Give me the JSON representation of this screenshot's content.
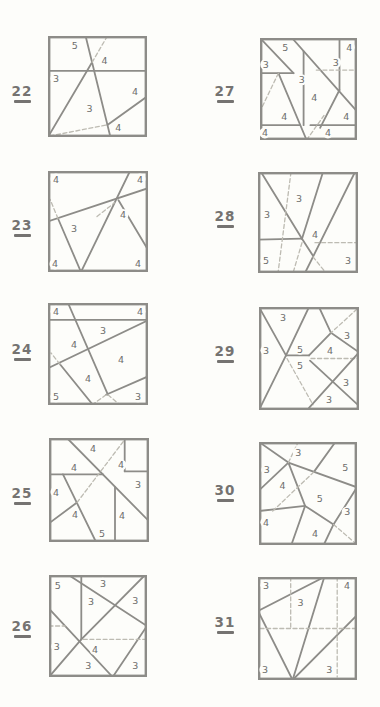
{
  "page": {
    "kind": "geometry-puzzle-sheet"
  },
  "colors": {
    "background": "#fdfdfa",
    "line": "#8d8c88",
    "dash": "#bdbbb2",
    "digit": "#6e6e6c",
    "number": "#757371"
  },
  "puzzles": [
    {
      "number": "22",
      "box": {
        "x": 48,
        "y": 36,
        "w": 99,
        "h": 101
      },
      "num_pos": {
        "x": 6,
        "y": 85
      },
      "segments": [
        [
          0,
          0.345,
          1,
          0.345,
          0
        ],
        [
          0.38,
          0,
          0.63,
          1,
          0
        ],
        [
          0,
          1,
          0.445,
          0.26,
          0
        ],
        [
          0.445,
          0.26,
          0.6,
          0,
          1
        ],
        [
          1,
          0.6,
          0.6,
          0.88,
          0
        ],
        [
          0.02,
          0.99,
          0.6,
          0.88,
          1
        ]
      ],
      "labels": [
        {
          "t": "5",
          "x": 0.27,
          "y": 0.09
        },
        {
          "t": "4",
          "x": 0.57,
          "y": 0.24
        },
        {
          "t": "3",
          "x": 0.08,
          "y": 0.42
        },
        {
          "t": "3",
          "x": 0.42,
          "y": 0.72
        },
        {
          "t": "4",
          "x": 0.88,
          "y": 0.55
        },
        {
          "t": "4",
          "x": 0.71,
          "y": 0.91
        }
      ]
    },
    {
      "number": "23",
      "box": {
        "x": 48,
        "y": 171,
        "w": 100,
        "h": 101
      },
      "num_pos": {
        "x": 6,
        "y": 219
      },
      "segments": [
        [
          0,
          0.5,
          1,
          0.17,
          0
        ],
        [
          0.82,
          0,
          0.33,
          1,
          0
        ],
        [
          0.33,
          1,
          0.1,
          0.47,
          0
        ],
        [
          0.1,
          0.47,
          0.02,
          0.28,
          1
        ],
        [
          0.705,
          0.29,
          1,
          0.78,
          0
        ],
        [
          0.49,
          0.45,
          0.665,
          0.315,
          1
        ]
      ],
      "labels": [
        {
          "t": "4",
          "x": 0.08,
          "y": 0.08
        },
        {
          "t": "4",
          "x": 0.92,
          "y": 0.08
        },
        {
          "t": "4",
          "x": 0.75,
          "y": 0.43
        },
        {
          "t": "3",
          "x": 0.26,
          "y": 0.57
        },
        {
          "t": "4",
          "x": 0.07,
          "y": 0.92
        },
        {
          "t": "4",
          "x": 0.9,
          "y": 0.92
        }
      ]
    },
    {
      "number": "24",
      "box": {
        "x": 48,
        "y": 303,
        "w": 100,
        "h": 102
      },
      "num_pos": {
        "x": 6,
        "y": 343
      },
      "segments": [
        [
          0,
          0.165,
          1,
          0.165,
          0
        ],
        [
          0.2,
          0,
          0.6,
          0.9,
          0
        ],
        [
          1,
          0.17,
          0,
          0.64,
          0
        ],
        [
          0.12,
          0.6,
          0.45,
          1,
          0
        ],
        [
          0.12,
          0.6,
          0.03,
          0.49,
          1
        ],
        [
          1,
          0.72,
          0.58,
          0.9,
          0
        ],
        [
          0.58,
          0.9,
          0.44,
          1,
          1
        ],
        [
          0.6,
          0.9,
          0.72,
          1,
          1
        ]
      ],
      "labels": [
        {
          "t": "4",
          "x": 0.08,
          "y": 0.08
        },
        {
          "t": "4",
          "x": 0.92,
          "y": 0.08
        },
        {
          "t": "3",
          "x": 0.55,
          "y": 0.27
        },
        {
          "t": "4",
          "x": 0.26,
          "y": 0.41
        },
        {
          "t": "4",
          "x": 0.73,
          "y": 0.55
        },
        {
          "t": "4",
          "x": 0.4,
          "y": 0.74
        },
        {
          "t": "5",
          "x": 0.08,
          "y": 0.92
        },
        {
          "t": "3",
          "x": 0.9,
          "y": 0.92
        }
      ]
    },
    {
      "number": "25",
      "box": {
        "x": 49,
        "y": 438,
        "w": 100,
        "h": 104
      },
      "num_pos": {
        "x": 6,
        "y": 487
      },
      "segments": [
        [
          0.18,
          0,
          1,
          0.8,
          0
        ],
        [
          0,
          0.35,
          0.54,
          0.35,
          0
        ],
        [
          0.757,
          0,
          0.757,
          0.32,
          0
        ],
        [
          0.757,
          0.32,
          1,
          0.32,
          0
        ],
        [
          0.14,
          0.35,
          0.47,
          1,
          0
        ],
        [
          0,
          0.82,
          0.28,
          0.62,
          0
        ],
        [
          0.28,
          0.62,
          0.77,
          0,
          1
        ],
        [
          0.66,
          0.47,
          0.66,
          1,
          0
        ]
      ],
      "labels": [
        {
          "t": "4",
          "x": 0.44,
          "y": 0.1
        },
        {
          "t": "4",
          "x": 0.25,
          "y": 0.28
        },
        {
          "t": "4",
          "x": 0.72,
          "y": 0.26
        },
        {
          "t": "3",
          "x": 0.89,
          "y": 0.45
        },
        {
          "t": "4",
          "x": 0.07,
          "y": 0.52
        },
        {
          "t": "4",
          "x": 0.26,
          "y": 0.74
        },
        {
          "t": "4",
          "x": 0.73,
          "y": 0.75
        },
        {
          "t": "5",
          "x": 0.53,
          "y": 0.92
        }
      ]
    },
    {
      "number": "26",
      "box": {
        "x": 49,
        "y": 575,
        "w": 98,
        "h": 102
      },
      "num_pos": {
        "x": 6,
        "y": 620
      },
      "segments": [
        [
          0.33,
          0,
          0.33,
          0.63,
          0
        ],
        [
          0.2,
          0,
          1,
          0.5,
          0
        ],
        [
          0.98,
          0,
          0.33,
          0.63,
          0
        ],
        [
          0,
          0.33,
          0.65,
          1,
          0
        ],
        [
          0.33,
          0.63,
          0,
          1,
          0
        ],
        [
          1,
          0.5,
          0.65,
          1,
          0
        ],
        [
          0,
          0.5,
          0.165,
          0.5,
          1
        ],
        [
          0.35,
          0.63,
          1,
          0.63,
          1
        ]
      ],
      "labels": [
        {
          "t": "5",
          "x": 0.09,
          "y": 0.1
        },
        {
          "t": "3",
          "x": 0.55,
          "y": 0.08
        },
        {
          "t": "3",
          "x": 0.43,
          "y": 0.26
        },
        {
          "t": "3",
          "x": 0.88,
          "y": 0.25
        },
        {
          "t": "3",
          "x": 0.08,
          "y": 0.7
        },
        {
          "t": "4",
          "x": 0.47,
          "y": 0.73
        },
        {
          "t": "3",
          "x": 0.4,
          "y": 0.89
        },
        {
          "t": "3",
          "x": 0.88,
          "y": 0.89
        }
      ]
    },
    {
      "number": "27",
      "box": {
        "x": 260,
        "y": 38,
        "w": 97,
        "h": 102
      },
      "num_pos": {
        "x": 209,
        "y": 85
      },
      "segments": [
        [
          0,
          0,
          0.345,
          0.345,
          0
        ],
        [
          0,
          0.345,
          0.345,
          0.345,
          0
        ],
        [
          0.33,
          0,
          1,
          0.72,
          0
        ],
        [
          0.82,
          0,
          0.82,
          0.51,
          0
        ],
        [
          0.58,
          0.315,
          1,
          0.315,
          1
        ],
        [
          0.45,
          0.13,
          0.45,
          0.855,
          0
        ],
        [
          0.82,
          0.51,
          0.62,
          0.88,
          0
        ],
        [
          0.19,
          0.345,
          0.48,
          1,
          0
        ],
        [
          0.19,
          0.345,
          0,
          0.72,
          1
        ],
        [
          0,
          0.855,
          0.41,
          0.855,
          0
        ],
        [
          0.52,
          0.855,
          1,
          0.855,
          0
        ],
        [
          0.48,
          1,
          0.66,
          0.76,
          1
        ]
      ],
      "labels": [
        {
          "t": "5",
          "x": 0.26,
          "y": 0.09
        },
        {
          "t": "4",
          "x": 0.92,
          "y": 0.09
        },
        {
          "t": "3",
          "x": 0.06,
          "y": 0.26
        },
        {
          "t": "3",
          "x": 0.78,
          "y": 0.24
        },
        {
          "t": "3",
          "x": 0.43,
          "y": 0.41
        },
        {
          "t": "4",
          "x": 0.56,
          "y": 0.58
        },
        {
          "t": "4",
          "x": 0.25,
          "y": 0.77
        },
        {
          "t": "4",
          "x": 0.89,
          "y": 0.77
        },
        {
          "t": "4",
          "x": 0.05,
          "y": 0.93
        },
        {
          "t": "4",
          "x": 0.7,
          "y": 0.93
        }
      ]
    },
    {
      "number": "28",
      "box": {
        "x": 258,
        "y": 172,
        "w": 100,
        "h": 101
      },
      "num_pos": {
        "x": 209,
        "y": 210
      },
      "segments": [
        [
          0.03,
          0,
          0.44,
          0.66,
          0
        ],
        [
          0,
          0.67,
          0.44,
          0.66,
          0
        ],
        [
          0.65,
          0,
          0.44,
          0.66,
          0
        ],
        [
          0.97,
          0,
          0.47,
          1,
          0
        ],
        [
          0.44,
          0.66,
          0.55,
          0.83,
          0
        ],
        [
          0.33,
          0,
          0.2,
          1,
          1
        ],
        [
          0.44,
          0.7,
          0.35,
          1,
          1
        ],
        [
          0.57,
          0.7,
          1,
          0.7,
          1
        ],
        [
          0.55,
          0.84,
          0.68,
          1,
          1
        ]
      ],
      "labels": [
        {
          "t": "3",
          "x": 0.41,
          "y": 0.26
        },
        {
          "t": "3",
          "x": 0.09,
          "y": 0.42
        },
        {
          "t": "4",
          "x": 0.57,
          "y": 0.62
        },
        {
          "t": "5",
          "x": 0.08,
          "y": 0.88
        },
        {
          "t": "3",
          "x": 0.9,
          "y": 0.88
        }
      ]
    },
    {
      "number": "29",
      "box": {
        "x": 259,
        "y": 307,
        "w": 100,
        "h": 103
      },
      "num_pos": {
        "x": 209,
        "y": 345
      },
      "segments": [
        [
          0,
          0,
          0.27,
          0.47,
          0
        ],
        [
          0.5,
          0,
          0.27,
          0.47,
          0
        ],
        [
          0.27,
          0.47,
          0.5,
          0.47,
          0
        ],
        [
          0.27,
          0.47,
          0,
          1,
          0
        ],
        [
          0.5,
          0.47,
          0.72,
          0.25,
          0
        ],
        [
          0.6,
          0,
          0.72,
          0.25,
          0
        ],
        [
          0.72,
          0.25,
          1,
          0.44,
          0
        ],
        [
          0.98,
          0.02,
          0.72,
          0.25,
          1
        ],
        [
          0.52,
          0.5,
          1,
          0.5,
          1
        ],
        [
          0.28,
          0.5,
          0.54,
          0.95,
          1
        ],
        [
          1,
          0.44,
          0.5,
          0.98,
          0
        ],
        [
          0.51,
          0.52,
          1,
          0.96,
          0
        ]
      ],
      "labels": [
        {
          "t": "3",
          "x": 0.24,
          "y": 0.1
        },
        {
          "t": "3",
          "x": 0.07,
          "y": 0.42
        },
        {
          "t": "5",
          "x": 0.41,
          "y": 0.41
        },
        {
          "t": "5",
          "x": 0.41,
          "y": 0.57
        },
        {
          "t": "3",
          "x": 0.88,
          "y": 0.28
        },
        {
          "t": "4",
          "x": 0.71,
          "y": 0.42
        },
        {
          "t": "3",
          "x": 0.87,
          "y": 0.73
        },
        {
          "t": "3",
          "x": 0.7,
          "y": 0.9
        }
      ]
    },
    {
      "number": "30",
      "box": {
        "x": 259,
        "y": 442,
        "w": 98,
        "h": 103
      },
      "num_pos": {
        "x": 209,
        "y": 484
      },
      "segments": [
        [
          0,
          0,
          0.3,
          0.2,
          0
        ],
        [
          0.3,
          0.2,
          0,
          0.47,
          0
        ],
        [
          0.3,
          0.2,
          1,
          0.44,
          0
        ],
        [
          0.78,
          0,
          0.56,
          0.29,
          0
        ],
        [
          0.3,
          0.2,
          0.47,
          0.62,
          0
        ],
        [
          0,
          0.67,
          0.47,
          0.62,
          0
        ],
        [
          0.47,
          0.62,
          0.33,
          1,
          0
        ],
        [
          0.47,
          0.62,
          0.76,
          0.8,
          0
        ],
        [
          1,
          0.44,
          0.76,
          0.8,
          0
        ],
        [
          0.76,
          0.8,
          0.66,
          1,
          0
        ],
        [
          0.3,
          0.2,
          0.4,
          0,
          1
        ],
        [
          0.56,
          0.29,
          0.13,
          0.68,
          1
        ],
        [
          0.76,
          0.8,
          0.98,
          0.98,
          1
        ]
      ],
      "labels": [
        {
          "t": "3",
          "x": 0.4,
          "y": 0.1
        },
        {
          "t": "3",
          "x": 0.08,
          "y": 0.27
        },
        {
          "t": "5",
          "x": 0.88,
          "y": 0.25
        },
        {
          "t": "4",
          "x": 0.24,
          "y": 0.42
        },
        {
          "t": "5",
          "x": 0.62,
          "y": 0.55
        },
        {
          "t": "3",
          "x": 0.9,
          "y": 0.68
        },
        {
          "t": "4",
          "x": 0.07,
          "y": 0.78
        },
        {
          "t": "4",
          "x": 0.57,
          "y": 0.89
        }
      ]
    },
    {
      "number": "31",
      "box": {
        "x": 258,
        "y": 577,
        "w": 99,
        "h": 103
      },
      "num_pos": {
        "x": 209,
        "y": 616
      },
      "segments": [
        [
          0,
          0.33,
          0.67,
          0,
          0
        ],
        [
          0,
          0.33,
          0.35,
          1,
          0
        ],
        [
          0.67,
          0,
          0.35,
          1,
          0
        ],
        [
          0.35,
          1,
          1,
          0.37,
          0
        ],
        [
          0.33,
          0,
          0.33,
          0.5,
          1
        ],
        [
          0.02,
          0.5,
          0.98,
          0.5,
          1
        ],
        [
          0.8,
          0,
          0.8,
          0.97,
          1
        ]
      ],
      "labels": [
        {
          "t": "3",
          "x": 0.08,
          "y": 0.08
        },
        {
          "t": "4",
          "x": 0.9,
          "y": 0.08
        },
        {
          "t": "3",
          "x": 0.43,
          "y": 0.25
        },
        {
          "t": "3",
          "x": 0.07,
          "y": 0.9
        },
        {
          "t": "3",
          "x": 0.72,
          "y": 0.9
        }
      ]
    }
  ]
}
